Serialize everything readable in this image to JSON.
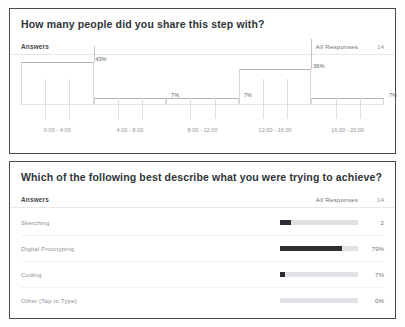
{
  "cards": [
    {
      "title": "How many people did you share this step with?",
      "answers_label": "Answers",
      "all_responses_label": "All Responses",
      "response_count": "14"
    },
    {
      "title": "Which of the following best describe what you were trying to achieve?",
      "answers_label": "Answers",
      "all_responses_label": "All Responses",
      "response_count": "14"
    }
  ],
  "chart_data": [
    {
      "type": "bar",
      "title": "How many people did you share this step with?",
      "xlabel": "",
      "ylabel": "",
      "grid": false,
      "legend": false,
      "ylim": [
        0,
        50
      ],
      "categories": [
        "0:00 - 4:00",
        "4:00 - 8:00",
        "8:00 - 12:00",
        "12:00 - 16:00",
        "16:00 - 20:00"
      ],
      "values": [
        43,
        7,
        7,
        36,
        7
      ],
      "data_labels": [
        "43%",
        "7%",
        "7%",
        "36%",
        "7%"
      ],
      "tick_labels": [
        "0:00 - 4:00",
        "4:00 - 8:00",
        "8:00 - 12:00",
        "12:00 - 16:00",
        "16:00 - 20:00"
      ]
    },
    {
      "type": "bar",
      "title": "Which of the following best describe what you were trying to achieve?",
      "orientation": "horizontal",
      "xlabel": "",
      "ylabel": "",
      "grid": false,
      "legend": false,
      "xlim": [
        0,
        100
      ],
      "categories": [
        "Sketching",
        "Digital Prototyping",
        "Coding",
        "Other (Tap to Type)"
      ],
      "values": [
        14,
        79,
        7,
        0
      ],
      "data_labels": [
        "2",
        "79%",
        "7%",
        "0%"
      ]
    }
  ],
  "bar_rows": [
    {
      "label": "Sketching",
      "value_text": "2",
      "fill_pct": 14
    },
    {
      "label": "Digital Prototyping",
      "value_text": "79%",
      "fill_pct": 79
    },
    {
      "label": "Coding",
      "value_text": "7%",
      "fill_pct": 7
    },
    {
      "label": "Other (Tap to Type)",
      "value_text": "0%",
      "fill_pct": 0
    }
  ],
  "histogram_bins": [
    {
      "label": "0:00 - 4:00",
      "pct_text": "43%",
      "pct": 43
    },
    {
      "label": "4:00 - 8:00",
      "pct_text": "7%",
      "pct": 7
    },
    {
      "label": "8:00 - 12:00",
      "pct_text": "7%",
      "pct": 7
    },
    {
      "label": "12:00 - 16:00",
      "pct_text": "36%",
      "pct": 36
    },
    {
      "label": "16:00 - 20:00",
      "pct_text": "7%",
      "pct": 7
    }
  ],
  "colors": {
    "card_border": "#444b52",
    "bar_fill": "#2b2f33",
    "bar_track": "#dfe1e4",
    "text_dark": "#2f3438",
    "text_muted": "#8e9399"
  }
}
